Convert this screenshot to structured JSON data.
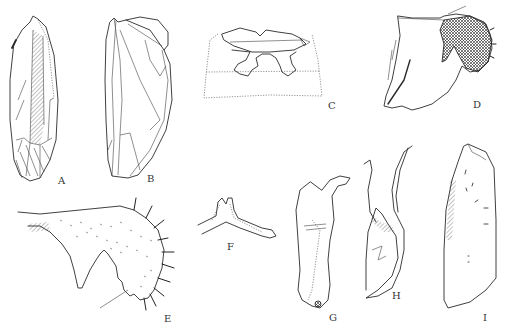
{
  "figure": {
    "panels": [
      {
        "id": "A",
        "label": "A",
        "subject": "forewing with hatched clavus"
      },
      {
        "id": "B",
        "label": "B",
        "subject": "hindwing / tegmen venation"
      },
      {
        "id": "C",
        "label": "C",
        "subject": "sternal apodeme"
      },
      {
        "id": "D",
        "label": "D",
        "subject": "male pygofer with cross-hatched lobe"
      },
      {
        "id": "E",
        "label": "E",
        "subject": "subgenital plate with setae"
      },
      {
        "id": "F",
        "label": "F",
        "subject": "connective"
      },
      {
        "id": "G",
        "label": "G",
        "subject": "style"
      },
      {
        "id": "H",
        "label": "H",
        "subject": "aedeagus lateral view"
      },
      {
        "id": "I",
        "label": "I",
        "subject": "plate / valve"
      }
    ]
  }
}
